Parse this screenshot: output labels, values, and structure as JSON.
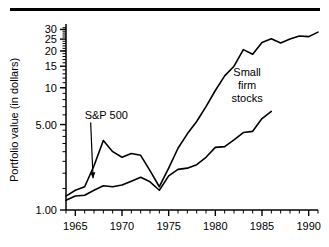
{
  "figure": {
    "has_top_rule": true,
    "background": "#ffffff",
    "ink_color": "#000000"
  },
  "chart_data": {
    "type": "line",
    "title": "",
    "xlabel": "",
    "ylabel": "Portfolio value (in dollars)",
    "yscale": "log",
    "xlim": [
      1964,
      1991
    ],
    "ylim": [
      1.0,
      32
    ],
    "grid": false,
    "legend": "annotations-inline",
    "y_tick_labels": [
      "1.00",
      "5.00",
      "10",
      "15",
      "20",
      "25",
      "30"
    ],
    "y_tick_values": [
      1.0,
      5.0,
      10,
      15,
      20,
      25,
      30
    ],
    "x_tick_labels": [
      "1965",
      "1970",
      "1975",
      "1980",
      "1985",
      "1990"
    ],
    "x_tick_values": [
      1965,
      1970,
      1975,
      1980,
      1985,
      1990
    ],
    "x_minor_step": 1,
    "annotations": [
      {
        "text": "S&P 500",
        "lines": [
          "S&P 500"
        ],
        "x": 1966.0,
        "y": 5.6,
        "points_to": {
          "x": 1966.9,
          "y": 1.75
        },
        "has_arrow": true
      },
      {
        "text": "Small firm stocks",
        "lines": [
          "Small",
          "firm",
          "stocks"
        ],
        "x": 1983.4,
        "y": 12.5,
        "has_arrow": false
      }
    ],
    "series": [
      {
        "name": "Small firm stocks",
        "x": [
          1964,
          1965,
          1966,
          1967,
          1968,
          1969,
          1970,
          1971,
          1972,
          1973,
          1974,
          1975,
          1976,
          1977,
          1978,
          1979,
          1980,
          1981,
          1982,
          1983,
          1984,
          1985,
          1986,
          1987,
          1988,
          1989,
          1990,
          1991
        ],
        "values": [
          1.3,
          1.45,
          1.55,
          2.3,
          3.7,
          3.0,
          2.7,
          2.9,
          2.8,
          2.1,
          1.55,
          2.2,
          3.2,
          4.2,
          5.3,
          7.0,
          9.5,
          12.5,
          15.0,
          20.5,
          18.8,
          23.5,
          25.2,
          23.2,
          25.0,
          26.5,
          26.2,
          28.5
        ]
      },
      {
        "name": "S&P 500",
        "x": [
          1964,
          1965,
          1966,
          1967,
          1968,
          1969,
          1970,
          1971,
          1972,
          1973,
          1974,
          1975,
          1976,
          1977,
          1978,
          1979,
          1980,
          1981,
          1982,
          1983,
          1984,
          1985,
          1986
        ],
        "values": [
          1.2,
          1.3,
          1.32,
          1.45,
          1.58,
          1.55,
          1.6,
          1.72,
          1.85,
          1.7,
          1.45,
          1.9,
          2.15,
          2.2,
          2.35,
          2.7,
          3.25,
          3.3,
          3.75,
          4.3,
          4.4,
          5.6,
          6.4
        ]
      }
    ]
  },
  "axis_titles": {
    "y": "Portfolio value (in dollars)"
  }
}
